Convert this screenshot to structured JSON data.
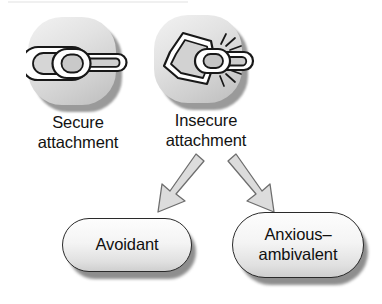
{
  "figure": {
    "background_color": "#ffffff",
    "ink_color": "#111111"
  },
  "nodes": [
    {
      "id": "secure",
      "label": "Secure\nattachment",
      "icon": "intact-chain-link-icon",
      "icon_description": "three interlocking chain links, unbroken"
    },
    {
      "id": "insecure",
      "label": "Insecure\nattachment",
      "icon": "broken-chain-link-icon",
      "icon_description": "bent chain link separated from a second link with radiating break lines"
    }
  ],
  "outcomes": [
    {
      "id": "avoidant",
      "label": "Avoidant"
    },
    {
      "id": "anxious-ambivalent",
      "label": "Anxious–\nambivalent"
    }
  ],
  "arrows": [
    {
      "id": "arrow-to-avoidant",
      "from": "insecure",
      "to": "avoidant",
      "direction": "down-left"
    },
    {
      "id": "arrow-to-anxious",
      "from": "insecure",
      "to": "anxious-ambivalent",
      "direction": "down-right"
    }
  ]
}
